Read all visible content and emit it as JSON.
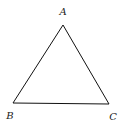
{
  "diagram": {
    "type": "triangle",
    "stroke_color": "#111111",
    "vertices": [
      {
        "label": "A",
        "x": 63,
        "y": 25,
        "label_x": 63,
        "label_y": 15
      },
      {
        "label": "B",
        "x": 13,
        "y": 103,
        "label_x": 10,
        "label_y": 119
      },
      {
        "label": "C",
        "x": 109,
        "y": 104,
        "label_x": 113,
        "label_y": 120
      }
    ]
  }
}
